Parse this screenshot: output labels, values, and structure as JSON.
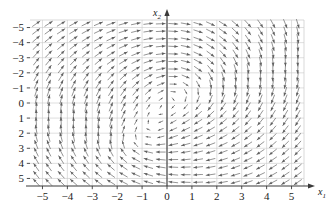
{
  "figure": {
    "type": "direction-field-plot",
    "background": "#ffffff",
    "axis_color": "#3a3a3a",
    "grid_color": "#c9c9c9",
    "arrow_color": "#5a5a5a"
  },
  "axes": {
    "x_label": "x",
    "x_label_sub": "1",
    "y_label": "x",
    "y_label_sub": "2",
    "x_ticks": [
      "−5",
      "−4",
      "−3",
      "−2",
      "−1",
      "0",
      "1",
      "2",
      "3",
      "4",
      "5"
    ],
    "y_ticks": [
      "5",
      "4",
      "3",
      "2",
      "1",
      "0",
      "−1",
      "−2",
      "−3",
      "−4",
      "−5"
    ]
  },
  "chart_data": {
    "type": "scatter",
    "subtype": "quiver-direction-field",
    "title": "",
    "xlabel": "x1",
    "ylabel": "x2",
    "xlim": [
      -5.5,
      5.5
    ],
    "ylim": [
      -5.5,
      5.5
    ],
    "xticks": [
      -5,
      -4,
      -3,
      -2,
      -1,
      0,
      1,
      2,
      3,
      4,
      5
    ],
    "yticks": [
      -5,
      -4,
      -3,
      -2,
      -1,
      0,
      1,
      2,
      3,
      4,
      5
    ],
    "grid": true,
    "legend": "none",
    "sample_step": 0.5,
    "sample_range": [
      -5.25,
      5.25
    ],
    "normalized_arrows": true,
    "arrow_length_px": 9,
    "equilibria_approx": [
      [
        0.5,
        0.5
      ],
      [
        -1.0,
        -2.5
      ]
    ],
    "field_definition": {
      "u_expression": "x2 - x1*x2 - 0.35*x1",
      "v_expression": "-x1 - x1*x2*0.25 + 0.6*x2"
    },
    "observed_directions": [
      {
        "x": -5,
        "y": 5,
        "angle_deg": -18
      },
      {
        "x": -4,
        "y": 5,
        "angle_deg": -15
      },
      {
        "x": -3,
        "y": 5,
        "angle_deg": -10
      },
      {
        "x": -2,
        "y": 5,
        "angle_deg": -4
      },
      {
        "x": -1,
        "y": 5,
        "angle_deg": 178
      },
      {
        "x": 0,
        "y": 5,
        "angle_deg": 176
      },
      {
        "x": 1,
        "y": 5,
        "angle_deg": 120
      },
      {
        "x": 2,
        "y": 5,
        "angle_deg": 100
      },
      {
        "x": 3,
        "y": 5,
        "angle_deg": 92
      },
      {
        "x": 4,
        "y": 5,
        "angle_deg": 90
      },
      {
        "x": 5,
        "y": 5,
        "angle_deg": 88
      },
      {
        "x": -5,
        "y": 0,
        "angle_deg": 38
      },
      {
        "x": -3,
        "y": 0,
        "angle_deg": 30
      },
      {
        "x": -1,
        "y": 0,
        "angle_deg": 10
      },
      {
        "x": 1,
        "y": 0,
        "angle_deg": 50
      },
      {
        "x": 3,
        "y": 0,
        "angle_deg": 45
      },
      {
        "x": 5,
        "y": 0,
        "angle_deg": 42
      },
      {
        "x": -5,
        "y": -5,
        "angle_deg": -88
      },
      {
        "x": -4,
        "y": -5,
        "angle_deg": -85
      },
      {
        "x": -3,
        "y": -5,
        "angle_deg": -70
      },
      {
        "x": -2,
        "y": -5,
        "angle_deg": -30
      },
      {
        "x": -1,
        "y": -5,
        "angle_deg": 2
      },
      {
        "x": 0,
        "y": -5,
        "angle_deg": 2
      },
      {
        "x": 1,
        "y": -5,
        "angle_deg": 3
      },
      {
        "x": 2,
        "y": -5,
        "angle_deg": 6
      },
      {
        "x": 3,
        "y": -5,
        "angle_deg": 12
      },
      {
        "x": 4,
        "y": -5,
        "angle_deg": 18
      },
      {
        "x": 5,
        "y": -5,
        "angle_deg": 25
      }
    ]
  }
}
